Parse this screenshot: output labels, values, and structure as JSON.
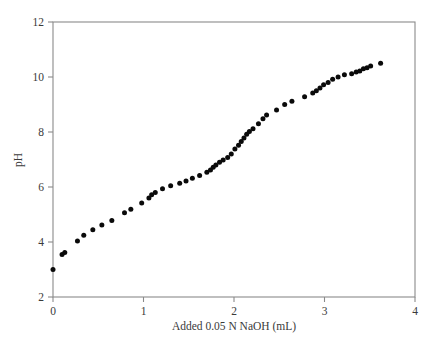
{
  "chart_data": {
    "type": "scatter",
    "title": "",
    "subtitle": "",
    "xlabel": "Added 0.05 N NaOH (mL)",
    "ylabel": "pH",
    "xlim": [
      0,
      4
    ],
    "ylim": [
      2,
      12
    ],
    "xticks": [
      0,
      1,
      2,
      3,
      4
    ],
    "yticks": [
      2,
      4,
      6,
      8,
      10,
      12
    ],
    "xtick_labels": [
      "0",
      "1",
      "2",
      "3",
      "4"
    ],
    "ytick_labels": [
      "2",
      "4",
      "6",
      "8",
      "10",
      "12"
    ],
    "grid": false,
    "legend": null,
    "marker": {
      "shape": "circle",
      "color": "#0a0a0a",
      "size_px": 5.0
    },
    "axis_color": "#8a8a8a",
    "frame": {
      "left": true,
      "bottom": true,
      "top": true,
      "right": true
    },
    "series": [
      {
        "name": "Titration curve",
        "x": [
          0.0,
          0.1,
          0.13,
          0.27,
          0.34,
          0.44,
          0.54,
          0.65,
          0.79,
          0.86,
          0.98,
          1.06,
          1.09,
          1.13,
          1.21,
          1.3,
          1.4,
          1.47,
          1.54,
          1.62,
          1.7,
          1.74,
          1.77,
          1.8,
          1.84,
          1.88,
          1.93,
          1.97,
          2.01,
          2.05,
          2.08,
          2.11,
          2.14,
          2.17,
          2.21,
          2.27,
          2.32,
          2.36,
          2.47,
          2.56,
          2.64,
          2.78,
          2.87,
          2.91,
          2.95,
          2.99,
          3.04,
          3.09,
          3.15,
          3.22,
          3.3,
          3.35,
          3.39,
          3.43,
          3.47,
          3.51,
          3.62
        ],
        "y": [
          3.0,
          3.55,
          3.62,
          4.04,
          4.25,
          4.45,
          4.62,
          4.78,
          5.06,
          5.19,
          5.42,
          5.6,
          5.72,
          5.8,
          5.94,
          6.05,
          6.14,
          6.22,
          6.32,
          6.42,
          6.54,
          6.62,
          6.72,
          6.8,
          6.9,
          6.98,
          7.07,
          7.2,
          7.38,
          7.52,
          7.65,
          7.78,
          7.92,
          8.02,
          8.12,
          8.3,
          8.48,
          8.62,
          8.8,
          9.0,
          9.12,
          9.28,
          9.42,
          9.5,
          9.6,
          9.72,
          9.8,
          9.92,
          10.0,
          10.08,
          10.12,
          10.18,
          10.22,
          10.3,
          10.34,
          10.4,
          10.5
        ]
      }
    ]
  },
  "axis_labels": {
    "x_title": "Added 0.05 N NaOH (mL)",
    "y_title": "pH"
  }
}
